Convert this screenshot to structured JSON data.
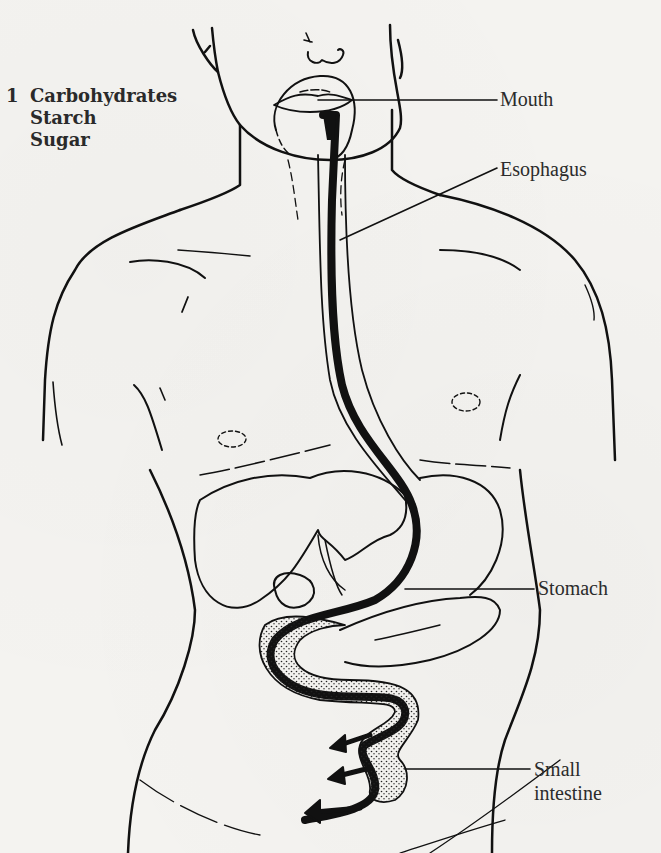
{
  "figure": {
    "heading": {
      "number": "1",
      "lines": [
        "Carbohydrates",
        "Starch",
        "Sugar"
      ]
    },
    "labels": {
      "mouth": "Mouth",
      "esophagus": "Esophagus",
      "stomach": "Stomach",
      "small_intestine_line1": "Small",
      "small_intestine_line2": "intestine"
    },
    "colors": {
      "ink": "#111111",
      "text": "#2b2b2b",
      "paper": "#f4f3f0"
    }
  }
}
